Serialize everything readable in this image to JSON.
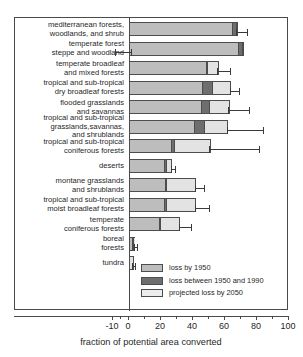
{
  "chart_data": {
    "type": "bar",
    "orientation": "horizontal",
    "stacked": true,
    "title": "",
    "xlabel": "fraction of potential area converted",
    "ylabel": "",
    "xlim": [
      -10,
      100
    ],
    "xticks": [
      -10,
      0,
      20,
      40,
      60,
      80,
      100
    ],
    "xticklabels": [
      "-10",
      "0",
      "20",
      "40",
      "60",
      "80",
      "100"
    ],
    "grid": false,
    "legend_position": "lower right (inside axes)",
    "legend": [
      {
        "key": "loss_by_1950",
        "label": "loss by 1950",
        "color": "#bdbdbd"
      },
      {
        "key": "loss_1950_1990",
        "label": "loss between 1950 and 1990",
        "color": "#6e6e6e"
      },
      {
        "key": "projected_2050",
        "label": "projected loss by 2050",
        "color": "#ececec"
      }
    ],
    "categories": [
      "mediterranean forests,\nwoodlands, and shrub",
      "temperate forest\nsteppe and woodland",
      "temperate broadleaf\nand mixed forests",
      "tropical and sub-tropical\ndry broadleaf forests",
      "flooded grasslands\nand savannas",
      "tropical and sub-tropical\ngrasslands,savannas,\nand shrublands",
      "tropical and sub-tropical\nconiferous forests",
      "deserts",
      "montane grasslands\nand shrublands",
      "tropical and sub-tropical\nmoist broadleaf forests",
      "temperate\nconiferous forests",
      "boreal\nforests",
      "tundra"
    ],
    "series": [
      {
        "name": "loss by 1950",
        "values": [
          65,
          69,
          49,
          46,
          45,
          41,
          26,
          22,
          23,
          22,
          19,
          2,
          0
        ]
      },
      {
        "name": "loss between 1950 and 1990",
        "values": [
          3,
          3,
          1,
          7,
          6,
          7,
          3,
          2,
          1,
          2,
          1,
          1,
          0
        ]
      },
      {
        "name": "projected loss by 2050",
        "values": [
          0,
          0,
          6,
          11,
          12,
          14,
          22,
          3,
          18,
          18,
          12,
          1,
          3
        ]
      }
    ],
    "totals": [
      68,
      72,
      56,
      64,
      63,
      62,
      51,
      27,
      42,
      42,
      32,
      4,
      3
    ],
    "error_bars": [
      {
        "category_index": 0,
        "center": 68,
        "low": 67,
        "high": 74
      },
      {
        "category_index": 1,
        "center": 0,
        "low": -9,
        "high": 1
      },
      {
        "category_index": 2,
        "center": 56,
        "low": 55,
        "high": 63
      },
      {
        "category_index": 3,
        "center": 64,
        "low": 63,
        "high": 69
      },
      {
        "category_index": 4,
        "center": 63,
        "low": 62,
        "high": 75
      },
      {
        "category_index": 5,
        "center": 62,
        "low": 61,
        "high": 84
      },
      {
        "category_index": 6,
        "center": 51,
        "low": 50,
        "high": 81
      },
      {
        "category_index": 7,
        "center": 27,
        "low": 26,
        "high": 29
      },
      {
        "category_index": 8,
        "center": 42,
        "low": 41,
        "high": 47
      },
      {
        "category_index": 9,
        "center": 42,
        "low": 41,
        "high": 50
      },
      {
        "category_index": 10,
        "center": 32,
        "low": 31,
        "high": 39
      },
      {
        "category_index": 11,
        "center": 4,
        "low": 3,
        "high": 5
      },
      {
        "category_index": 12,
        "center": 3,
        "low": 2,
        "high": 4
      }
    ]
  }
}
